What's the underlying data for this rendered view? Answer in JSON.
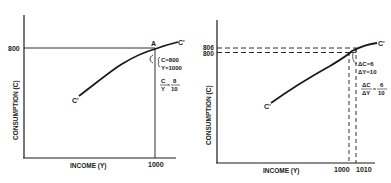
{
  "left_panel": {
    "y_axis_label": "CONSUMPTION (C)",
    "x_axis_label": "INCOME (Y)",
    "y_tick": "800",
    "x_tick": "1000",
    "point_label": "A",
    "curve_start_label": "C'",
    "curve_end_label": "C'",
    "annot_c": "C=800",
    "annot_y": "Y=1000",
    "ratio_num": "C",
    "ratio_den": "Y",
    "ratio_eq": "=",
    "ratio_val_num": "8",
    "ratio_val_den": "10"
  },
  "right_panel": {
    "y_axis_label": "CONSUMPTION (C)",
    "x_axis_label": "INCOME (Y)",
    "y_tick_upper": "806",
    "y_tick_lower": "800",
    "x_tick_left": "1000",
    "x_tick_right": "1010",
    "curve_start_label": "C'",
    "curve_end_label": "C'",
    "annot_dc": "ΔC=6",
    "annot_dy": "ΔY=10",
    "ratio_num": "ΔC",
    "ratio_den": "ΔY",
    "ratio_eq": "=",
    "ratio_val_num": "6",
    "ratio_val_den": "10"
  },
  "colors": {
    "ink": "#1a1a1a",
    "background": "#ffffff"
  }
}
